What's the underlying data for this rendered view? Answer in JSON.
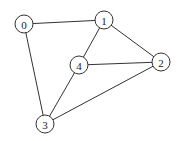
{
  "graph": {
    "nodes": [
      {
        "id": "0",
        "label": "0",
        "x": 24,
        "y": 24
      },
      {
        "id": "1",
        "label": "1",
        "x": 104,
        "y": 20
      },
      {
        "id": "2",
        "label": "2",
        "x": 161,
        "y": 62
      },
      {
        "id": "3",
        "label": "3",
        "x": 45,
        "y": 124
      },
      {
        "id": "4",
        "label": "4",
        "x": 79,
        "y": 65
      }
    ],
    "edges": [
      [
        "0",
        "1"
      ],
      [
        "0",
        "3"
      ],
      [
        "1",
        "4"
      ],
      [
        "1",
        "2"
      ],
      [
        "4",
        "2"
      ],
      [
        "4",
        "3"
      ],
      [
        "3",
        "2"
      ]
    ],
    "node_radius": 9,
    "colors": {
      "stroke": "#333333",
      "fill": "#ffffff",
      "text": "#222222"
    }
  }
}
